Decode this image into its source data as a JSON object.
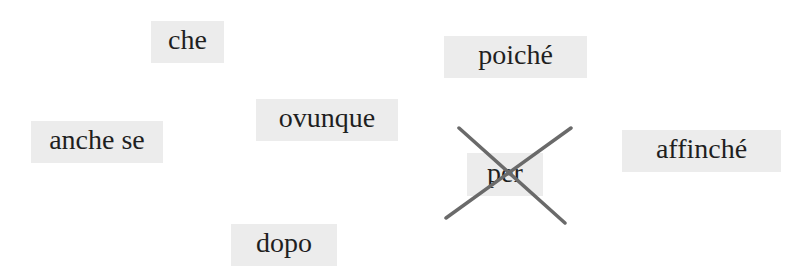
{
  "words": [
    {
      "id": "che",
      "label": "che",
      "x": 151,
      "y": 21,
      "w": 73,
      "h": 42,
      "crossed": false
    },
    {
      "id": "poiche",
      "label": "poiché",
      "x": 444,
      "y": 36,
      "w": 143,
      "h": 42,
      "crossed": false
    },
    {
      "id": "anche-se",
      "label": "anche se",
      "x": 31,
      "y": 121,
      "w": 132,
      "h": 42,
      "crossed": false
    },
    {
      "id": "ovunque",
      "label": "ovunque",
      "x": 256,
      "y": 99,
      "w": 142,
      "h": 42,
      "crossed": false
    },
    {
      "id": "per",
      "label": "per",
      "x": 467,
      "y": 153,
      "w": 76,
      "h": 43,
      "crossed": true
    },
    {
      "id": "affinche",
      "label": "affinché",
      "x": 622,
      "y": 130,
      "w": 159,
      "h": 42,
      "crossed": false
    },
    {
      "id": "dopo",
      "label": "dopo",
      "x": 231,
      "y": 224,
      "w": 106,
      "h": 42,
      "crossed": false
    }
  ],
  "cross_mark": {
    "target": "per",
    "color": "#6a6a6a",
    "line1": {
      "x1": 459,
      "y1": 128,
      "x2": 565,
      "y2": 223
    },
    "line2": {
      "x1": 571,
      "y1": 128,
      "x2": 446,
      "y2": 218
    }
  },
  "colors": {
    "card_bg": "#ececec",
    "text": "#1f1f1f",
    "background": "#ffffff"
  }
}
